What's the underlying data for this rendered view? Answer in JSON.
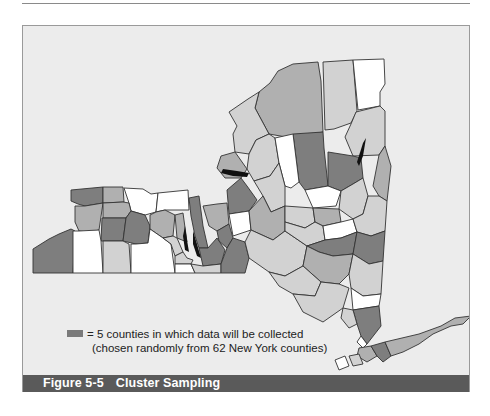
{
  "figure": {
    "number": "Figure 5-5",
    "title": "Cluster Sampling"
  },
  "legend": {
    "swatch_color": "#7a7a7a",
    "line1": "= 5 counties in which data will be collected",
    "line2": "(chosen randomly from 62 New York counties)"
  },
  "map": {
    "subject": "New York State counties",
    "total_counties": 62,
    "sampled_counties": 5,
    "shade_colors": {
      "white": "#ffffff",
      "light": "#d2d2d2",
      "medium": "#b0b0b0",
      "dark": "#7e7e7e",
      "water": "#111111"
    }
  }
}
